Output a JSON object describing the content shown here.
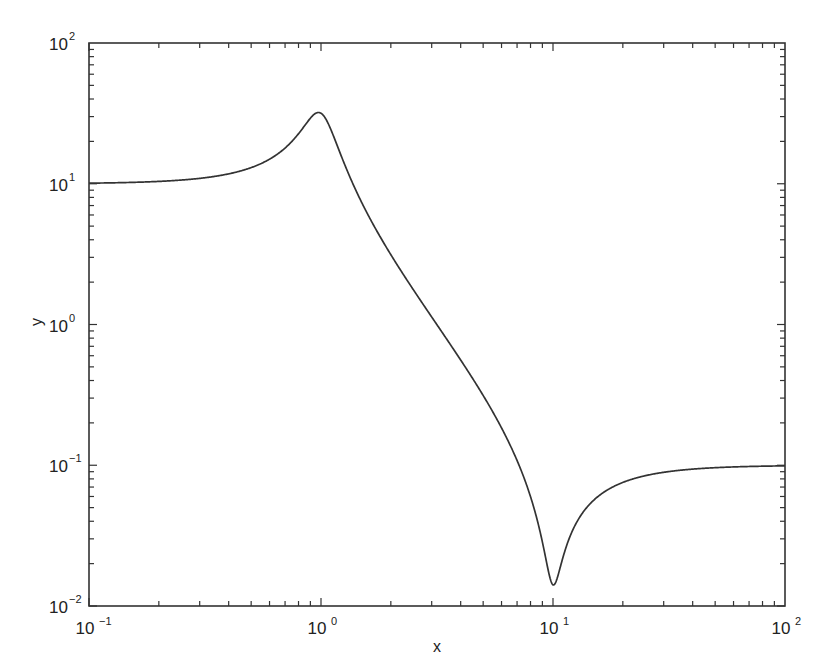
{
  "chart_data": {
    "type": "line",
    "title": "",
    "xlabel": "x",
    "ylabel": "y",
    "xscale": "log",
    "yscale": "log",
    "xlim": [
      0.1,
      100
    ],
    "ylim": [
      0.01,
      100
    ],
    "grid": false,
    "legend": null,
    "x_ticks": [
      {
        "base": "10",
        "exp": "-1",
        "value": 0.1
      },
      {
        "base": "10",
        "exp": "0",
        "value": 1
      },
      {
        "base": "10",
        "exp": "1",
        "value": 10
      },
      {
        "base": "10",
        "exp": "2",
        "value": 100
      }
    ],
    "y_ticks": [
      {
        "base": "10",
        "exp": "-2",
        "value": 0.01
      },
      {
        "base": "10",
        "exp": "-1",
        "value": 0.1
      },
      {
        "base": "10",
        "exp": "0",
        "value": 1
      },
      {
        "base": "10",
        "exp": "1",
        "value": 10
      },
      {
        "base": "10",
        "exp": "2",
        "value": 100
      }
    ],
    "series": [
      {
        "name": "y",
        "color": "#333333",
        "model": "y = 0.1*|(100 - x^2 + j*z2*x)/(1 - x^2 + j*x/Q)|",
        "params": {
          "Q": 3.2,
          "z2": 1.4
        },
        "x": [
          0.1,
          0.2,
          0.3,
          0.5,
          0.7,
          0.9,
          0.95,
          1.0,
          1.1,
          1.3,
          1.5,
          2,
          3,
          4,
          5,
          6,
          7,
          8,
          9,
          9.5,
          10,
          10.5,
          11,
          12,
          15,
          20,
          30,
          50,
          100
        ],
        "y": [
          10.0,
          10.3,
          10.9,
          13.2,
          19.2,
          31.0,
          31.8,
          31.6,
          19.5,
          9.4,
          6.2,
          3.2,
          1.13,
          0.56,
          0.33,
          0.22,
          0.15,
          0.095,
          0.053,
          0.031,
          0.0145,
          0.028,
          0.047,
          0.077,
          0.088,
          0.096,
          0.099,
          0.1,
          0.1
        ]
      }
    ],
    "notable_points": {
      "peak": {
        "x": 0.95,
        "y": 31.6
      },
      "notch": {
        "x": 10,
        "y": 0.0145
      }
    }
  }
}
